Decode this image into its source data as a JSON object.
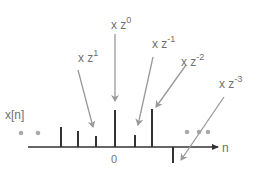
{
  "diagram": {
    "signal_label": "x[n]",
    "axis_label": "n",
    "origin_label": "0",
    "colors": {
      "stem": "#333333",
      "axis": "#333333",
      "arrow": "#999999",
      "dot": "#aaaaaa",
      "text": "#707070"
    },
    "multipliers": [
      {
        "id": "z1",
        "base": "x z",
        "exp": "1"
      },
      {
        "id": "z0",
        "base": "x z",
        "exp": "0"
      },
      {
        "id": "zm1",
        "base": "x z",
        "exp": "-1"
      },
      {
        "id": "zm2",
        "base": "x z",
        "exp": "-2"
      },
      {
        "id": "zm3",
        "base": "x z",
        "exp": "-3"
      }
    ],
    "stems": [
      {
        "n": -3,
        "value": 0.55
      },
      {
        "n": -2,
        "value": 0.43
      },
      {
        "n": -1,
        "value": 0.3
      },
      {
        "n": 0,
        "value": 1.0
      },
      {
        "n": 1,
        "value": 0.33
      },
      {
        "n": 2,
        "value": 1.03
      },
      {
        "n": 3,
        "value": -0.43
      }
    ],
    "ellipsis_left": "• •",
    "ellipsis_right": "• • •"
  }
}
